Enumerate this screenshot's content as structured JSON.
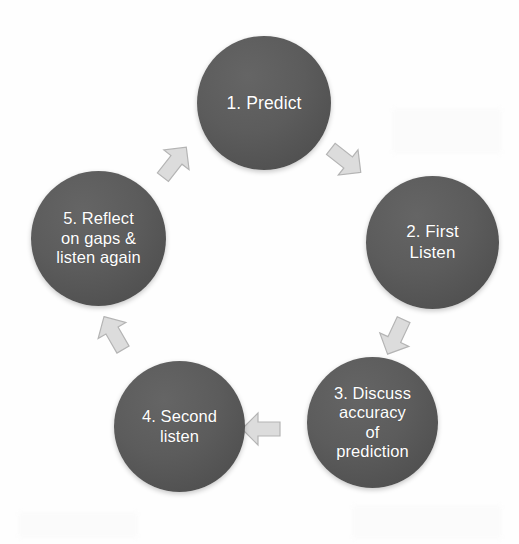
{
  "diagram": {
    "type": "cycle",
    "title": "",
    "background_color": "#fefefe",
    "node_color": "#5a5a5a",
    "node_text_color": "#ffffff",
    "arrow_color": "#d8d8d8",
    "direction": "clockwise",
    "nodes": [
      {
        "id": "1",
        "label": "1. Predict"
      },
      {
        "id": "2",
        "label": "2. First\nListen"
      },
      {
        "id": "3",
        "label": "3. Discuss\naccuracy\nof\nprediction"
      },
      {
        "id": "4",
        "label": "4. Second\nlisten"
      },
      {
        "id": "5",
        "label": "5. Reflect\non gaps &\nlisten again"
      }
    ],
    "arrows": [
      {
        "id": "5-1",
        "from": "5",
        "to": "1",
        "icon": "arrow-up-right-icon"
      },
      {
        "id": "1-2",
        "from": "1",
        "to": "2",
        "icon": "arrow-down-right-icon"
      },
      {
        "id": "2-3",
        "from": "2",
        "to": "3",
        "icon": "arrow-down-left-icon"
      },
      {
        "id": "3-4",
        "from": "3",
        "to": "4",
        "icon": "arrow-left-icon"
      },
      {
        "id": "4-5",
        "from": "4",
        "to": "5",
        "icon": "arrow-up-left-icon"
      }
    ]
  }
}
